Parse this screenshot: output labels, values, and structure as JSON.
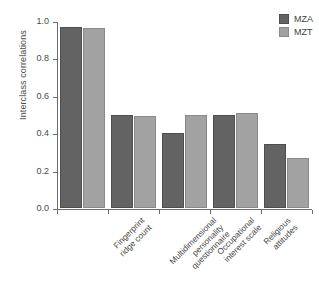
{
  "chart_data": {
    "type": "bar",
    "title": "",
    "xlabel": "",
    "ylabel": "Interclass correlations",
    "ylim": [
      0.0,
      1.0
    ],
    "ytick_labels": [
      "0.0",
      "0.2",
      "0.4",
      "0.6",
      "0.8",
      "1.0"
    ],
    "ytick_values": [
      0.0,
      0.2,
      0.4,
      0.6,
      0.8,
      1.0
    ],
    "grid": false,
    "legend_position": "top-right",
    "categories": [
      "Fingerprint\nridge count",
      "Multidimensional\npersonality\nquestionnaire",
      "Occupational\ninterest scale",
      "Religious\nattitudes",
      "Nonreligious\nsocial attitudes"
    ],
    "category_lines": [
      [
        "Fingerprint",
        "ridge count"
      ],
      [
        "Multidimensional",
        "personality",
        "questionnaire"
      ],
      [
        "Occupational",
        "interest scale"
      ],
      [
        "Religious",
        "attitudes"
      ],
      [
        "Nonreligious",
        "social attitudes"
      ]
    ],
    "series": [
      {
        "name": "MZA",
        "color": "#636363",
        "values": [
          0.97,
          0.5,
          0.4,
          0.5,
          0.34
        ]
      },
      {
        "name": "MZT",
        "color": "#a2a2a2",
        "values": [
          0.96,
          0.49,
          0.5,
          0.51,
          0.27
        ]
      }
    ]
  },
  "legend": {
    "items": [
      {
        "label": "MZA",
        "color": "#636363"
      },
      {
        "label": "MZT",
        "color": "#a2a2a2"
      }
    ]
  },
  "axes": {
    "y_label": "Interclass correlations"
  }
}
